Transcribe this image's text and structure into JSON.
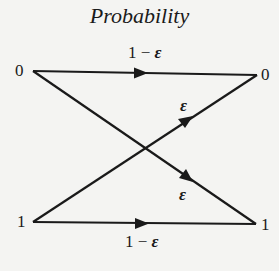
{
  "title": "Probability",
  "nodes": {
    "input_top": "0",
    "input_bottom": "1",
    "output_top": "0",
    "output_bottom": "1"
  },
  "edges": {
    "top_straight": {
      "from": "0",
      "to": "0",
      "label_prefix": "1 − ",
      "label_eps": "ε"
    },
    "bottom_to_top": {
      "from": "1",
      "to": "0",
      "label_eps": "ε"
    },
    "top_to_bottom": {
      "from": "0",
      "to": "1",
      "label_eps": "ε"
    },
    "bottom_straight": {
      "from": "1",
      "to": "1",
      "label_prefix": "1 − ",
      "label_eps": "ε"
    }
  },
  "colors": {
    "line": "#1a1a1a",
    "background": "#f4f4f2"
  }
}
